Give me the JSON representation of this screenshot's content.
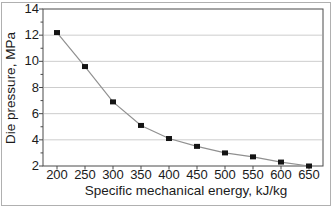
{
  "figure": {
    "background": "#ffffff",
    "outer_border_color": "#b0b0b0"
  },
  "chart_data": {
    "type": "line",
    "title": "",
    "xlabel": "Specific mechanical energy, kJ/kg",
    "ylabel": "Die pressure, MPa",
    "categories": [
      200,
      250,
      300,
      350,
      400,
      450,
      500,
      550,
      600,
      650
    ],
    "values": [
      12.2,
      9.6,
      6.9,
      5.1,
      4.1,
      3.5,
      3.0,
      2.7,
      2.3,
      2.0
    ],
    "ylim": [
      2,
      14
    ],
    "yticks": [
      2,
      4,
      6,
      8,
      10,
      12,
      14
    ],
    "y_minor_ticks": [
      3,
      5,
      7,
      9,
      11,
      13
    ],
    "grid": "horizontal-major",
    "legend": "none",
    "marker": "filled-square",
    "marker_color": "#141414",
    "line_color": "#909090",
    "gridline_color": "#cdcdcd",
    "axis_color": "#4a4a4a",
    "text_color": "#1b1b1b"
  }
}
